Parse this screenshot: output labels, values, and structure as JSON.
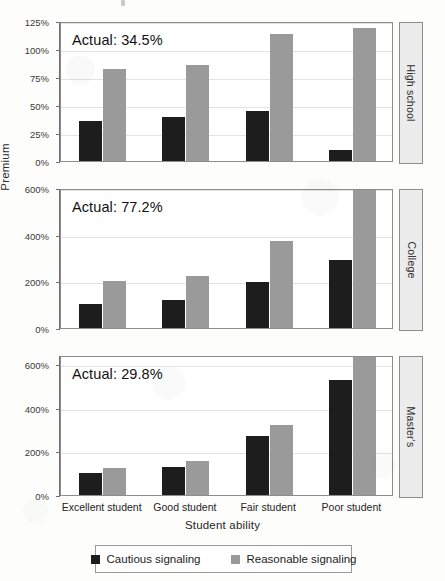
{
  "axis": {
    "ylabel": "Premium",
    "xlabel": "Student ability"
  },
  "legend": {
    "items": [
      {
        "label": "Cautious signaling",
        "color": "#1d1d1d",
        "key": "cautious"
      },
      {
        "label": "Reasonable signaling",
        "color": "#9a9a9a",
        "key": "reasonable"
      }
    ]
  },
  "panels": [
    {
      "strip_label": "High school",
      "annotation": "Actual: 34.5%",
      "ticks": [
        "0%",
        "25%",
        "50%",
        "75%",
        "100%",
        "125%"
      ],
      "tick_values": [
        0,
        25,
        50,
        75,
        100,
        125
      ],
      "ymax": 125
    },
    {
      "strip_label": "College",
      "annotation": "Actual: 77.2%",
      "ticks": [
        "0%",
        "200%",
        "400%",
        "600%"
      ],
      "tick_values": [
        0,
        200,
        400,
        600
      ],
      "ymax": 600
    },
    {
      "strip_label": "Master's",
      "annotation": "Actual: 29.8%",
      "ticks": [
        "0%",
        "200%",
        "400%",
        "600%"
      ],
      "tick_values": [
        0,
        200,
        400,
        600
      ],
      "ymax": 640
    }
  ],
  "chart_data": {
    "type": "bar",
    "title": "",
    "xlabel": "Student ability",
    "ylabel": "Premium",
    "grid": true,
    "legend_position": "bottom",
    "categories": [
      "Excellent student",
      "Good student",
      "Fair student",
      "Poor student"
    ],
    "facets": [
      {
        "name": "High school",
        "annotation": "Actual: 34.5%",
        "actual": 34.5,
        "ylim": [
          0,
          125
        ],
        "yticks": [
          0,
          25,
          50,
          75,
          100,
          125
        ],
        "series": [
          {
            "name": "Cautious signaling",
            "values": [
              36,
              39,
              45,
              10
            ]
          },
          {
            "name": "Reasonable signaling",
            "values": [
              82,
              86,
              113,
              119
            ]
          }
        ]
      },
      {
        "name": "College",
        "annotation": "Actual: 77.2%",
        "actual": 77.2,
        "ylim": [
          0,
          600
        ],
        "yticks": [
          0,
          200,
          400,
          600
        ],
        "series": [
          {
            "name": "Cautious signaling",
            "values": [
              105,
              120,
              198,
              290
            ]
          },
          {
            "name": "Reasonable signaling",
            "values": [
              200,
              225,
              372,
              620
            ],
            "clipped": [
              false,
              false,
              false,
              true
            ]
          }
        ]
      },
      {
        "name": "Master's",
        "annotation": "Actual: 29.8%",
        "actual": 29.8,
        "ylim": [
          0,
          600
        ],
        "yticks": [
          0,
          200,
          400,
          600
        ],
        "series": [
          {
            "name": "Cautious signaling",
            "values": [
              100,
              130,
              270,
              525
            ]
          },
          {
            "name": "Reasonable signaling",
            "values": [
              125,
              155,
              320,
              650
            ],
            "clipped": [
              false,
              false,
              false,
              true
            ]
          }
        ]
      }
    ]
  }
}
